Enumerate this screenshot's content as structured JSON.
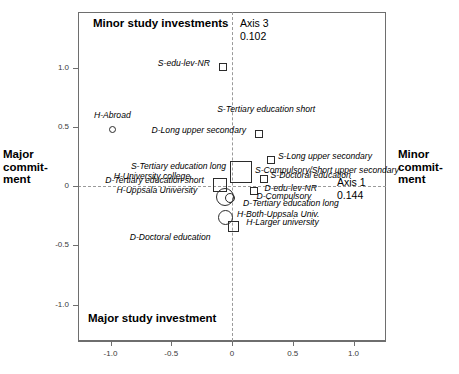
{
  "figure": {
    "width": 459,
    "height": 374,
    "background": "#ffffff",
    "frame_color": "#6e6e6e",
    "marker_color": "#2b2b2b"
  },
  "captions": {
    "top": "Minor study investments",
    "bottom": "Major study investment",
    "left_line1": "Major",
    "left_line2": "commit-",
    "left_line3": "ment",
    "right_line1": "Minor",
    "right_line2": "commit-",
    "right_line3": "ment"
  },
  "axis_notes": {
    "axis3_name": "Axis 3",
    "axis3_value": "0.102",
    "axis1_name": "Axis 1",
    "axis1_value": "0.144"
  },
  "chart_data": {
    "type": "scatter",
    "title": "",
    "subtitle": "",
    "xlabel": "Axis 1 (0.144)",
    "ylabel": "Axis 3 (0.102)",
    "xlim": [
      -1.28,
      1.28
    ],
    "ylim": [
      -1.28,
      1.28
    ],
    "grid": false,
    "legend": "none",
    "zero_lines": true,
    "xticks": [
      -1.0,
      -0.5,
      0,
      0.5,
      1.0
    ],
    "xticklabels": [
      "-1.0",
      "-0.5",
      "0",
      "0.5",
      "1.0"
    ],
    "yticks": [
      1.0,
      0.5,
      0,
      -0.5,
      -1.0
    ],
    "yticklabels": [
      "1.0",
      "0.5",
      "0",
      "-0.5",
      "-1.0"
    ],
    "annotations": [
      "Minor study investments",
      "Major study investment",
      "Major commitment",
      "Minor commitment",
      "Axis 3 0.102",
      "Axis 1 0.144"
    ],
    "series": [
      {
        "name": "Squares",
        "marker": "square",
        "points": [
          {
            "label": "S-edu-lev-NR",
            "x": -0.075,
            "y": 1.005,
            "size": 8,
            "label_dx": -13,
            "label_dy": -4,
            "align": "end"
          },
          {
            "label": "D-Long upper secondary",
            "x": 0.223,
            "y": 0.435,
            "size": 8,
            "label_dx": -13,
            "label_dy": -4,
            "align": "end"
          },
          {
            "label": "S-Tertiary education short",
            "x": 0.355,
            "y": 0.54,
            "size": 0,
            "label_dx": -58,
            "label_dy": -13,
            "align": "start"
          },
          {
            "label": "S-Long upper secondary",
            "x": 0.32,
            "y": 0.22,
            "size": 8,
            "label_dx": 7,
            "label_dy": -4,
            "align": "start"
          },
          {
            "label": "S-Tertiary education long",
            "x": 0.075,
            "y": 0.115,
            "size": 22,
            "label_dx": -15,
            "label_dy": -6,
            "align": "end"
          },
          {
            "label": "S-Compulsory/Short upper secondary",
            "x": 0.14,
            "y": 0.11,
            "size": 0,
            "label_dx": 6,
            "label_dy": -3,
            "align": "start"
          },
          {
            "label": "S-Doctoral education",
            "x": 0.26,
            "y": 0.055,
            "size": 8,
            "label_dx": 7,
            "label_dy": -4,
            "align": "start"
          },
          {
            "label": "D-Tertiary education short",
            "x": -0.1,
            "y": 0.005,
            "size": 14,
            "label_dx": -16,
            "label_dy": -5,
            "align": "end"
          },
          {
            "label": "D-edu-lev-NR",
            "x": 0.185,
            "y": -0.04,
            "size": 8,
            "label_dx": 10,
            "label_dy": -3,
            "align": "start"
          },
          {
            "label": "D-Compulsory",
            "x": 0.16,
            "y": -0.115,
            "size": 0,
            "label_dx": 5,
            "label_dy": -4,
            "align": "start"
          },
          {
            "label": "D-Tertiary education long",
            "x": 0.075,
            "y": -0.18,
            "size": 0,
            "label_dx": 2,
            "label_dy": -4,
            "align": "start"
          },
          {
            "label": "H-Larger university",
            "x": 0.01,
            "y": -0.345,
            "size": 11,
            "label_dx": 13,
            "label_dy": -5,
            "align": "start"
          },
          {
            "label": "D-Doctoral education",
            "x": -0.43,
            "y": -0.47,
            "size": 0,
            "label_dx": -50,
            "label_dy": -5,
            "align": "start"
          }
        ]
      },
      {
        "name": "Circles",
        "marker": "circle",
        "points": [
          {
            "label": "H-Abroad",
            "x": -0.985,
            "y": 0.48,
            "size": 7,
            "label_dx": 0,
            "label_dy": -14,
            "align": "center"
          },
          {
            "label": "H-University college",
            "x": -0.015,
            "y": -0.105,
            "size": 10,
            "label_dx": -40,
            "label_dy": -22,
            "align": "end"
          },
          {
            "label": "H-Uppsala University",
            "x": -0.055,
            "y": -0.095,
            "size": 18,
            "label_dx": -28,
            "label_dy": -7,
            "align": "end"
          },
          {
            "label": "H-Both-Uppsala Univ.",
            "x": -0.05,
            "y": -0.27,
            "size": 15,
            "label_dx": 11,
            "label_dy": -4,
            "align": "start"
          }
        ]
      }
    ]
  }
}
